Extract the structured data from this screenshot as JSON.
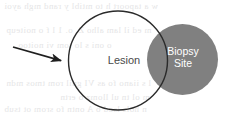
{
  "figure": {
    "background_color": "#ffffff",
    "width": 237,
    "height": 118
  },
  "shapes": {
    "lesion_circle": {
      "name": "lesion-circle",
      "cx": 118,
      "cy": 60.5,
      "r": 49.5,
      "fill": "none",
      "stroke": "#2b2b2b",
      "stroke_width": 1.4
    },
    "biopsy_circle": {
      "name": "biopsy-site-circle",
      "cx": 182.5,
      "cy": 59.5,
      "r": 35.5,
      "fill": "#808080",
      "stroke": "none"
    },
    "pointer_arrow": {
      "name": "pointer-arrow",
      "x1": 13,
      "y1": 47,
      "x2": 63,
      "y2": 61,
      "color": "#1f1f1f",
      "stroke_width": 1.8,
      "direction": "right-down"
    }
  },
  "labels": {
    "lesion": "Lesion",
    "biopsy_line1": "Biopsy",
    "biopsy_line2": "Site"
  },
  "colors": {
    "gray_fill": "#808080",
    "outline": "#2b2b2b",
    "lesion_text": "#4a4a4a",
    "biopsy_text": "#ffffff",
    "ghost_text": "#cfcfd2"
  },
  "ghost_artifacts": [
    {
      "text": "w a tapoort h to mtibl y rand mgh ayoi",
      "x": 4,
      "y": 1
    },
    {
      "text": "m ed il  lam  alho  Z. o. 1   l f o noiteup",
      "x": 6,
      "y": 25
    },
    {
      "text": "o oni s  lo  tom vi  noitoo",
      "x": 18,
      "y": 40
    },
    {
      "text": "l s iiano  fo as  VI  gnil  rom tmos mdn",
      "x": 6,
      "y": 78
    },
    {
      "text": "m ol  tn  ul  llomz  o  ertn",
      "x": 60,
      "y": 92
    },
    {
      "text": "n hols  lsod  o  A  ontn  fo srom ot tsub",
      "x": 4,
      "y": 104
    }
  ]
}
